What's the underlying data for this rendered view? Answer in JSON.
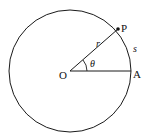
{
  "diagram": {
    "type": "circle-arc-radian",
    "stroke_color": "#1a1a1a",
    "background": "#ffffff",
    "circle": {
      "cx": 70,
      "cy": 71,
      "r": 61
    },
    "center_label": "O",
    "point_labels": {
      "P": "P",
      "A": "A"
    },
    "radius_label": "r",
    "arc_label": "s",
    "angle_label": "θ"
  }
}
